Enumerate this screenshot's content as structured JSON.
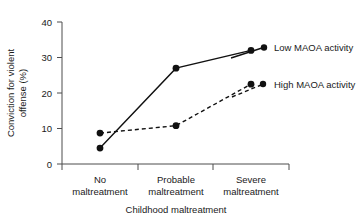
{
  "chart_data": {
    "type": "line",
    "title": "",
    "xlabel": "Childhood maltreatment",
    "ylabel": "Conviction for violent offense (%)",
    "ylabel_line1": "Conviction for violent",
    "ylabel_line2": "offense (%)",
    "categories": [
      "No maltreatment",
      "Probable maltreatment",
      "Severe maltreatment"
    ],
    "category_lines": [
      [
        "No",
        "maltreatment"
      ],
      [
        "Probable",
        "maltreatment"
      ],
      [
        "Severe",
        "maltreatment"
      ]
    ],
    "ylim": [
      0,
      40
    ],
    "yticks": [
      0,
      10,
      20,
      30,
      40
    ],
    "ytick_labels": [
      "0",
      "10",
      "20",
      "30",
      "40"
    ],
    "grid": false,
    "legend_position": "right",
    "series": [
      {
        "name": "Low MAOA activity",
        "style": "solid",
        "color": "#111111",
        "values": [
          4.5,
          27.0,
          32.0
        ]
      },
      {
        "name": "High MAOA activity",
        "style": "dashed",
        "color": "#111111",
        "values": [
          8.7,
          10.8,
          22.5
        ]
      }
    ]
  },
  "legend": {
    "items": [
      {
        "label": "Low MAOA activity"
      },
      {
        "label": "High MAOA activity"
      }
    ]
  }
}
